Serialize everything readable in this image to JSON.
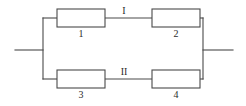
{
  "figure": {
    "background_color": "#ffffff",
    "stroke_color": "#4a4a4a",
    "text_color": "#2b2b2b",
    "width": 246,
    "height": 106
  },
  "branches": [
    {
      "id": "branch-top",
      "label": "I",
      "label_x": 124,
      "label_y": 14
    },
    {
      "id": "branch-bottom",
      "label": "II",
      "label_x": 124,
      "label_y": 75
    }
  ],
  "components": [
    {
      "id": "resistor-1",
      "label": "1",
      "x": 57,
      "y": 9,
      "width": 48,
      "height": 18,
      "label_x": 81,
      "label_y": 37
    },
    {
      "id": "resistor-2",
      "label": "2",
      "x": 152,
      "y": 9,
      "width": 48,
      "height": 18,
      "label_x": 176,
      "label_y": 37
    },
    {
      "id": "resistor-3",
      "label": "3",
      "x": 57,
      "y": 70,
      "width": 48,
      "height": 18,
      "label_x": 81,
      "label_y": 98
    },
    {
      "id": "resistor-4",
      "label": "4",
      "x": 152,
      "y": 70,
      "width": 48,
      "height": 18,
      "label_x": 176,
      "label_y": 98
    }
  ],
  "wires": {
    "terminal_left": "M15,50 L43,50",
    "terminal_right": "M203,50 L233,50",
    "bus_left": "M43,18 L43,79",
    "bus_right": "M203,18 L203,79",
    "top_left_stub": "M43,18 L57,18",
    "top_middle": "M105,18 L152,18",
    "top_right_stub": "M200,18 L203,18",
    "bottom_left_stub": "M43,79 L57,79",
    "bottom_middle": "M105,79 L152,79",
    "bottom_right_stub": "M200,79 L203,79"
  }
}
